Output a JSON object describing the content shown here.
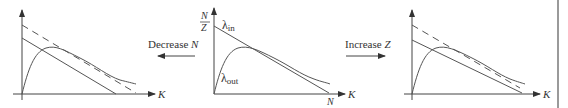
{
  "figure": {
    "colors": {
      "line": "#555555",
      "axis": "#444444",
      "text": "#333333",
      "divider": "#9a9a9a"
    },
    "panels": [
      {
        "id": "left",
        "x_axis_label": "K",
        "curves": [
          "λ_in (decreased N, solid)",
          "λ_in original (dashed)",
          "λ_out"
        ]
      },
      {
        "id": "middle",
        "y_intercept_label_num": "N",
        "y_intercept_label_den": "Z",
        "x_intercept_label": "N",
        "x_axis_label": "K",
        "lambda_in_label": "λ",
        "lambda_in_sub": "in",
        "lambda_out_label": "λ",
        "lambda_out_sub": "out"
      },
      {
        "id": "right",
        "x_axis_label": "K",
        "curves": [
          "λ_in (increased Z, solid)",
          "λ_in original (dashed)",
          "λ_out"
        ]
      }
    ],
    "transitions": [
      {
        "label_text": "Decrease ",
        "label_var": "N",
        "direction": "left"
      },
      {
        "label_text": "Increase ",
        "label_var": "Z",
        "direction": "right"
      }
    ]
  }
}
